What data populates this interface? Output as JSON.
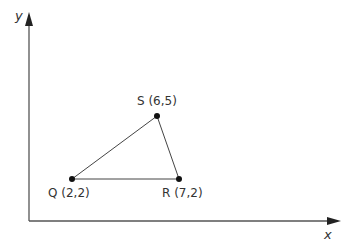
{
  "axes": {
    "x_label": "x",
    "y_label": "y"
  },
  "points": [
    {
      "name": "Q",
      "label": "Q (2,2)",
      "x": 2,
      "y": 2
    },
    {
      "name": "R",
      "label": "R (7,2)",
      "x": 7,
      "y": 2
    },
    {
      "name": "S",
      "label": "S (6,5)",
      "x": 6,
      "y": 5
    }
  ],
  "shape": "triangle QRS",
  "colors": {
    "line": "#444444",
    "point": "#111111",
    "axis": "#555555"
  }
}
